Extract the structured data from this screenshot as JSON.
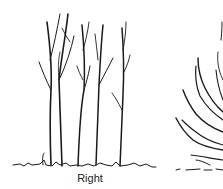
{
  "figure": {
    "left_panel": {
      "caption": "Right",
      "subject": "upright multi-stem shrub with vertical stems"
    },
    "right_panel": {
      "caption": "",
      "subject": "spreading shrub with arching branches (partially cropped)"
    },
    "colors": {
      "ink": "#1a1a1a",
      "background": "#ffffff"
    }
  }
}
